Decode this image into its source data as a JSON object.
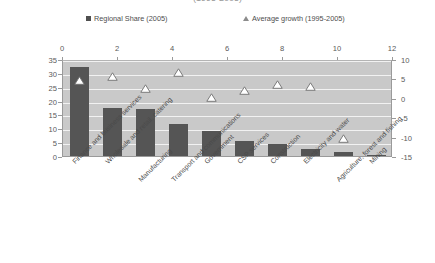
{
  "chart_data": {
    "type": "bar",
    "title": "(1995-2005)",
    "xlabel": "",
    "ylabel": "",
    "categories": [
      "Finance and business services",
      "Wholesale and retail, catering",
      "Manufacturing",
      "Transport and communications",
      "Government",
      "CSP services",
      "Construction",
      "Electricity and water",
      "Agriculture, forest and fishing",
      "Mining"
    ],
    "series": [
      {
        "name": "Regional Share (2005)",
        "type": "bar",
        "axis": "left",
        "color": "#555555",
        "values": [
          32,
          17.5,
          17,
          11.5,
          9,
          5.5,
          4.5,
          2.5,
          1.5,
          0.5
        ]
      },
      {
        "name": "Average growth (1995-2005)",
        "type": "scatter",
        "axis": "right",
        "marker": "triangle-open",
        "color": "#ffffff",
        "values": [
          5,
          6,
          3,
          7,
          0.5,
          2.5,
          4,
          3.5,
          -10,
          null
        ]
      }
    ],
    "left_axis": {
      "ticks": [
        "35",
        "30",
        "25",
        "20",
        "15",
        "10",
        "5",
        "0"
      ],
      "min": 0,
      "max": 35
    },
    "right_axis": {
      "ticks": [
        "10",
        "5",
        "0",
        "-5",
        "-10",
        "-15"
      ],
      "min": -15,
      "max": 10
    },
    "top_axis": {
      "ticks": [
        "0",
        "2",
        "4",
        "6",
        "8",
        "10",
        "12"
      ],
      "min": 0,
      "max": 12
    },
    "grid": true,
    "legend_position": "top",
    "plot_background": "#c9c9c9",
    "gridline_color": "#f2f2f2"
  },
  "legend": {
    "items": [
      {
        "label": "Regional Share (2005)",
        "marker": "square-filled"
      },
      {
        "label": "Average growth (1995-2005)",
        "marker": "triangle-open"
      }
    ]
  }
}
